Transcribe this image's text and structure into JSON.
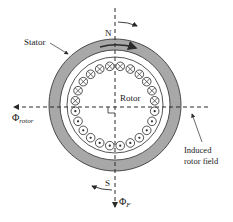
{
  "diagram": {
    "labels": {
      "stator": "Stator",
      "rotor": "Rotor",
      "north": "N",
      "south": "S",
      "phi_rotor_main": "Φ",
      "phi_rotor_sub": "rotor",
      "phi_f_main": "Φ",
      "phi_f_sub": "F",
      "induced_line1": "Induced",
      "induced_line2": "rotor field"
    },
    "conductors": {
      "upper_half_symbol": "cross (into page)",
      "lower_half_symbol": "dot (out of page)",
      "count_per_half": 12
    },
    "colors": {
      "stator_fill": "#a8a8a8",
      "stroke": "#2a2a2a",
      "background": "#ffffff"
    }
  }
}
